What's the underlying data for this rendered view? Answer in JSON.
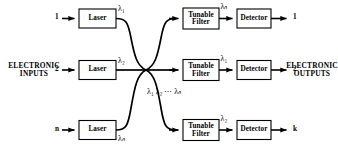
{
  "figure": {
    "type": "block-diagram",
    "topic": "wavelength-division-multiplexed broadcast star network",
    "background": "#ffffff",
    "line_color": "#000000"
  },
  "labels": {
    "electronic_inputs": "ELECTRONIC INPUTS",
    "electronic_inputs_line1": "ELECTRONIC",
    "electronic_inputs_line2": "INPUTS",
    "electronic_outputs_line1": "ELECTRONIC",
    "electronic_outputs_line2": "OUTPUTS",
    "coupler_wavelengths": "λ₁  λ₂ ⋯ λₙ"
  },
  "blocks": {
    "laser": "Laser",
    "tunable_filter_line1": "Tunable",
    "tunable_filter_line2": "Filter",
    "detector": "Detector"
  },
  "rows": [
    {
      "input_number": "1",
      "laser_label": "Laser",
      "laser_wavelength": "λ₁",
      "filter_label": "Tunable Filter",
      "filter_wavelength": "λₙ",
      "detector_label": "Detector",
      "output_number": "1"
    },
    {
      "input_number": "2",
      "laser_label": "Laser",
      "laser_wavelength": "λ₂",
      "filter_label": "Tunable Filter",
      "filter_wavelength": "λ₁",
      "detector_label": "Detector",
      "output_number": "2"
    },
    {
      "input_number": "n",
      "laser_label": "Laser",
      "laser_wavelength": "λₙ",
      "filter_label": "Tunable Filter",
      "filter_wavelength": "λ₂",
      "detector_label": "Detector",
      "output_number": "k"
    }
  ]
}
